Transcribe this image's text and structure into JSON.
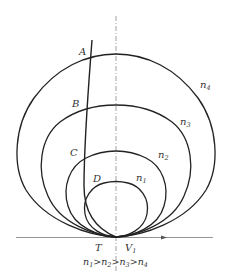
{
  "diagram": {
    "points": [
      {
        "id": "A",
        "label": "A"
      },
      {
        "id": "B",
        "label": "B"
      },
      {
        "id": "C",
        "label": "C"
      },
      {
        "id": "D",
        "label": "D"
      },
      {
        "id": "T",
        "label": "T"
      }
    ],
    "velocity_label": {
      "base": "V",
      "sub": "1"
    },
    "curves": [
      {
        "id": "n4",
        "base": "n",
        "sub": "4"
      },
      {
        "id": "n3",
        "base": "n",
        "sub": "3"
      },
      {
        "id": "n2",
        "base": "n",
        "sub": "2"
      },
      {
        "id": "n1",
        "base": "n",
        "sub": "1"
      }
    ],
    "caption": {
      "parts": [
        {
          "base": "n",
          "sub": "1"
        },
        {
          "op": ">"
        },
        {
          "base": "n",
          "sub": "2"
        },
        {
          "op": ">"
        },
        {
          "base": "n",
          "sub": "3"
        },
        {
          "op": ">"
        },
        {
          "base": "n",
          "sub": "4"
        }
      ]
    },
    "colors": {
      "line": "#222222",
      "axis": "#777777",
      "text": "#333333"
    }
  }
}
